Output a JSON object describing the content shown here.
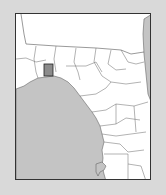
{
  "map": {
    "region": "Florida Panhandle and west peninsula counties",
    "highlighted_county": "Franklin County area (shaded rectangle)",
    "colors": {
      "background": "#d9d9d9",
      "land": "#ffffff",
      "water": "#bfbfbf",
      "borders": "#555555",
      "highlight_fill": "#8c8c8c",
      "highlight_stroke": "#222222"
    }
  }
}
